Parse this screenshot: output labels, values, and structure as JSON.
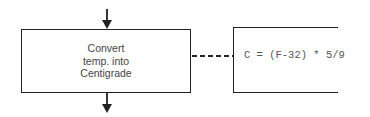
{
  "diagram": {
    "type": "flowchart-annotation",
    "process": {
      "label": "Convert\ntemp. into\nCentigrade"
    },
    "annotation": {
      "text": "C = (F-32) * 5/9"
    },
    "connectors": [
      {
        "from": "above",
        "to": "process",
        "style": "solid-arrow"
      },
      {
        "from": "process",
        "to": "below",
        "style": "solid-arrow"
      },
      {
        "from": "process",
        "to": "annotation",
        "style": "dashed-line"
      }
    ],
    "colors": {
      "stroke": "#222222",
      "text": "#444444",
      "background": "#ffffff"
    }
  }
}
